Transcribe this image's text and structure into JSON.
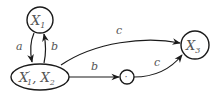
{
  "diagram": {
    "type": "state-automaton",
    "colors": {
      "stroke": "#1a1a1a",
      "label": "#555555",
      "background": "#ffffff"
    },
    "nodes": [
      {
        "id": "X1",
        "label": "X",
        "sub": "1",
        "shape": "circle"
      },
      {
        "id": "X1p_X2",
        "label_a": "X",
        "sup_a": "′",
        "sub_a": "1",
        "sep": ", ",
        "label_b": "X",
        "sub_b": "2",
        "shape": "ellipse"
      },
      {
        "id": "dot",
        "label": "·",
        "shape": "circle"
      },
      {
        "id": "X3",
        "label": "X",
        "sub": "3",
        "shape": "circle"
      }
    ],
    "edges": [
      {
        "from": "X1",
        "to": "X1p_X2",
        "label": "a"
      },
      {
        "from": "X1p_X2",
        "to": "X1",
        "label": "b"
      },
      {
        "from": "X1p_X2",
        "to": "X3",
        "label": "c"
      },
      {
        "from": "X1p_X2",
        "to": "dot",
        "label": "b"
      },
      {
        "from": "dot",
        "to": "X3",
        "label": "c"
      }
    ]
  }
}
